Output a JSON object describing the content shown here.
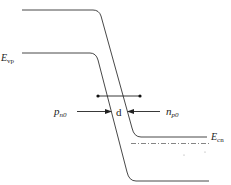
{
  "diagram": {
    "type": "energy-band-diagram",
    "labels": {
      "valence_band_left": {
        "main": "E",
        "sub": "vp"
      },
      "conduction_band_right": {
        "main": "E",
        "sub": "cn"
      },
      "left_carrier": {
        "main": "p",
        "sub": "n0"
      },
      "right_carrier": {
        "main": "n",
        "sub": "p0"
      },
      "width": "d"
    },
    "colors": {
      "line": "#333333",
      "dashdot": "#666666",
      "background": "#ffffff"
    }
  }
}
